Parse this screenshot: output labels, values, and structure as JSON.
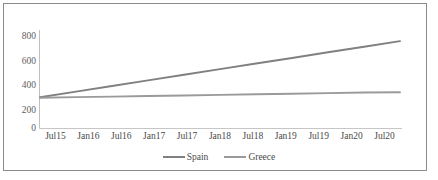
{
  "chart_data": {
    "type": "line",
    "title": "",
    "xlabel": "",
    "ylabel": "",
    "categories": [
      "Jul15",
      "Jan16",
      "Jul16",
      "Jan17",
      "Jul17",
      "Jan18",
      "Jul18",
      "Jan19",
      "Jul19",
      "Jan20",
      "Jul20"
    ],
    "series": [
      {
        "name": "Spain",
        "color": "#808080",
        "values": [
          270,
          319,
          368,
          416,
          465,
          513,
          562,
          610,
          659,
          707,
          756
        ]
      },
      {
        "name": "Greece",
        "color": "#9a9a9a",
        "values": [
          266,
          271,
          276,
          281,
          286,
          291,
          296,
          301,
          306,
          311,
          313
        ]
      }
    ],
    "yticks": [
      0,
      200,
      400,
      600,
      800
    ],
    "ylim": [
      0,
      870
    ],
    "grid": false,
    "legend_position": "bottom"
  },
  "legend": {
    "entries": [
      {
        "label": "Spain"
      },
      {
        "label": "Greece"
      }
    ]
  },
  "axis": {
    "y_tick_labels": [
      "800",
      "600",
      "400",
      "200",
      "0"
    ],
    "x_tick_labels": [
      "Jul15",
      "Jan16",
      "Jul16",
      "Jan17",
      "Jul17",
      "Jan18",
      "Jul18",
      "Jan19",
      "Jul19",
      "Jan20",
      "Jul20"
    ]
  },
  "colors": {
    "spain_line": "#808080",
    "greece_line": "#9a9a9a",
    "axis": "#b0b0b0",
    "frame_border": "#8a8a8a",
    "tick_text": "#5e5e5e"
  }
}
